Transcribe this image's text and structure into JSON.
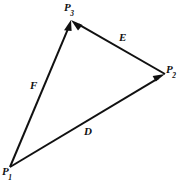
{
  "figure": {
    "background_color": "#ffffff",
    "line_color": "#111111",
    "width": 180,
    "height": 183,
    "type": "vector-triangle-diagram"
  },
  "points": [
    {
      "id": "P1",
      "label": "P",
      "subscript": "1",
      "x": 10,
      "y": 167
    },
    {
      "id": "P2",
      "label": "P",
      "subscript": "2",
      "x": 165,
      "y": 74
    },
    {
      "id": "P3",
      "label": "P",
      "subscript": "3",
      "x": 71,
      "y": 20
    }
  ],
  "vectors": [
    {
      "id": "D",
      "label": "D",
      "from": "P1",
      "to": "P2",
      "arrow_at": "P2"
    },
    {
      "id": "E",
      "label": "E",
      "from": "P2",
      "to": "P3",
      "arrow_at": "P3"
    },
    {
      "id": "F",
      "label": "F",
      "from": "P1",
      "to": "P3",
      "arrow_at": "P3"
    }
  ]
}
